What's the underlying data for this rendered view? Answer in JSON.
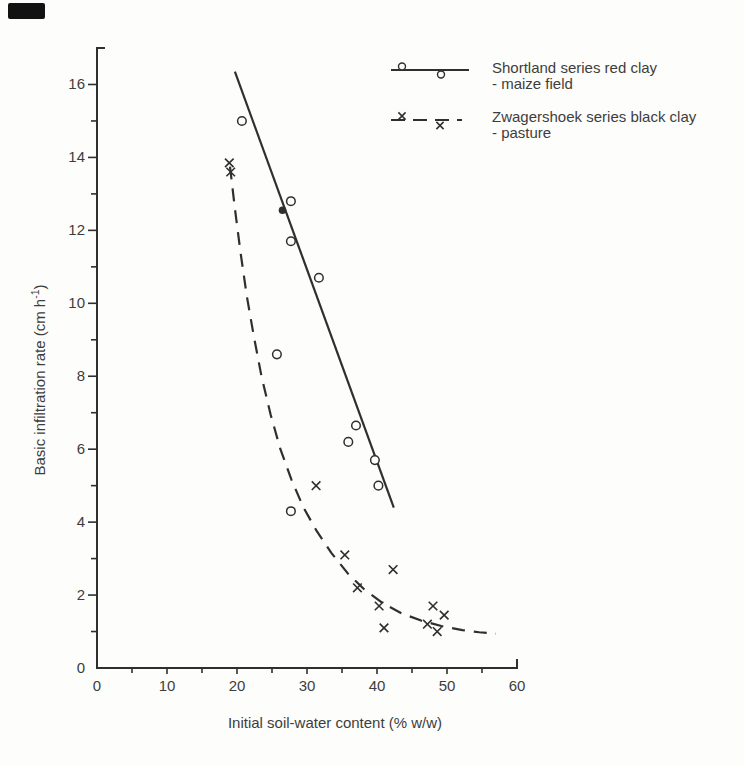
{
  "figure": {
    "paper_color": "#fdfdfb",
    "ink_color": "#2f2f2f",
    "text_color": "#3d3d3d",
    "scan_mark_color": "#121212"
  },
  "chart_data": {
    "type": "scatter",
    "title": "",
    "xlabel": "Initial soil-water content (% w/w)",
    "ylabel": "Basic infiltration rate (cm h⁻¹)",
    "ylabel_parts": {
      "base": "Basic infiltration rate (cm h",
      "sup": "-1",
      "end": ")"
    },
    "xlim": [
      0,
      60
    ],
    "ylim": [
      0,
      17
    ],
    "grid": false,
    "legend_position": "top-right",
    "x_major_ticks": [
      0,
      10,
      20,
      30,
      40,
      50,
      60
    ],
    "x_minor_ticks": [
      5,
      15,
      25,
      35,
      45,
      55
    ],
    "y_major_ticks": [
      2,
      4,
      6,
      8,
      10,
      12,
      14,
      16
    ],
    "y_minor_ticks": [
      1,
      3,
      5,
      7,
      9,
      11,
      13,
      15
    ],
    "y_origin_label": "0",
    "x_origin_label": "0",
    "series": [
      {
        "name": "Shortland series red clay",
        "subtitle": "- maize field",
        "marker": "circle",
        "line_style": "solid",
        "points": [
          [
            20.7,
            15.0
          ],
          [
            27.7,
            12.8
          ],
          [
            27.7,
            11.7
          ],
          [
            31.7,
            10.7
          ],
          [
            25.7,
            8.6
          ],
          [
            37.0,
            6.65
          ],
          [
            35.9,
            6.2
          ],
          [
            39.7,
            5.7
          ],
          [
            40.2,
            5.0
          ],
          [
            27.7,
            4.3
          ]
        ],
        "filled_points": [
          [
            26.5,
            12.55
          ]
        ],
        "fit_line": [
          [
            19.7,
            16.35
          ],
          [
            42.4,
            4.4
          ]
        ]
      },
      {
        "name": "Zwagershoek series black clay",
        "subtitle": "- pasture",
        "marker": "x",
        "line_style": "dashed",
        "points": [
          [
            18.9,
            13.85
          ],
          [
            19.1,
            13.6
          ],
          [
            31.3,
            5.0
          ],
          [
            35.4,
            3.1
          ],
          [
            42.3,
            2.7
          ],
          [
            37.2,
            2.2
          ],
          [
            40.3,
            1.7
          ],
          [
            48.0,
            1.7
          ],
          [
            49.6,
            1.45
          ],
          [
            47.2,
            1.2
          ],
          [
            41.0,
            1.1
          ],
          [
            48.6,
            1.0
          ]
        ],
        "filled_points": [],
        "fit_curve": [
          [
            19.0,
            13.75
          ],
          [
            19.7,
            12.6
          ],
          [
            20.5,
            11.4
          ],
          [
            21.4,
            10.2
          ],
          [
            22.4,
            9.1
          ],
          [
            23.5,
            8.0
          ],
          [
            24.8,
            6.95
          ],
          [
            26.2,
            6.0
          ],
          [
            27.8,
            5.15
          ],
          [
            29.5,
            4.4
          ],
          [
            31.4,
            3.75
          ],
          [
            33.5,
            3.15
          ],
          [
            35.8,
            2.6
          ],
          [
            38.2,
            2.15
          ],
          [
            40.8,
            1.78
          ],
          [
            43.5,
            1.5
          ],
          [
            46.3,
            1.3
          ],
          [
            49.2,
            1.15
          ],
          [
            52.2,
            1.04
          ],
          [
            54.6,
            0.98
          ],
          [
            57.0,
            0.94
          ]
        ]
      }
    ]
  },
  "legend": {
    "entries": [
      {
        "label": "Shortland series red clay",
        "sublabel": "- maize field"
      },
      {
        "label": "Zwagershoek series black clay",
        "sublabel": "- pasture"
      }
    ]
  }
}
